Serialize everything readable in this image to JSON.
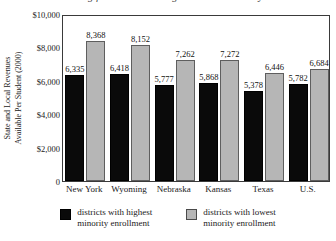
{
  "title_clipped": "State Funding for Students in High and Low Minority Districts",
  "axis": {
    "y_caption_line1": "State and Local Revenues",
    "y_caption_line2": "Available Per Student (2000)",
    "y_ticks": [
      "$10,000",
      "$8,000",
      "$6,000",
      "$4,000",
      "$2,000"
    ],
    "zero_label": "0"
  },
  "legend": {
    "entries": [
      {
        "label_line1": "districts with highest",
        "label_line2": "minority enrollment",
        "color": "#0a0a0a"
      },
      {
        "label_line1": "districts with lowest",
        "label_line2": "minority enrollment",
        "color": "#b6b6b6"
      }
    ]
  },
  "chart_data": {
    "type": "bar",
    "title": "State Funding for Students in High and Low Minority Districts",
    "xlabel": "",
    "ylabel": "State and Local Revenues Available Per Student (2000)",
    "ylim": [
      0,
      10000
    ],
    "ytick_values": [
      0,
      2000,
      4000,
      6000,
      8000,
      10000
    ],
    "grid": false,
    "legend_position": "bottom",
    "categories": [
      "New York",
      "Wyoming",
      "Nebraska",
      "Kansas",
      "Texas",
      "U.S."
    ],
    "series": [
      {
        "name": "districts with highest minority enrollment",
        "color": "#0a0a0a",
        "values": [
          6335,
          6418,
          5777,
          5868,
          5378,
          5782
        ],
        "labels": [
          "6,335",
          "6,418",
          "5,777",
          "5,868",
          "5,378",
          "5,782"
        ]
      },
      {
        "name": "districts with lowest minority enrollment",
        "color": "#b6b6b6",
        "values": [
          8368,
          8152,
          7262,
          7272,
          6446,
          6684
        ],
        "labels": [
          "8,368",
          "8,152",
          "7,262",
          "7,272",
          "6,446",
          "6,684"
        ]
      }
    ]
  }
}
